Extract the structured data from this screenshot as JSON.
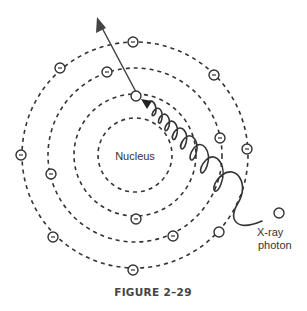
{
  "figure": {
    "caption": "FIGURE 2–29",
    "nucleus_label": "Nucleus",
    "photon_label_line1": "X-ray",
    "photon_label_line2": "photon",
    "colors": {
      "stroke": "#333333",
      "background": "#ffffff"
    },
    "center": [
      135,
      155
    ],
    "rings": [
      {
        "name": "shell-1",
        "radius": 37
      },
      {
        "name": "shell-2",
        "radius": 61
      },
      {
        "name": "shell-3",
        "radius": 87
      },
      {
        "name": "shell-4",
        "radius": 113
      }
    ],
    "electrons": [
      {
        "shell": 2,
        "x": 136,
        "y": 219
      },
      {
        "shell": 3,
        "x": 107,
        "y": 72
      },
      {
        "shell": 3,
        "x": 51,
        "y": 174
      },
      {
        "shell": 3,
        "x": 220,
        "y": 138
      },
      {
        "shell": 3,
        "x": 173,
        "y": 236
      },
      {
        "shell": 4,
        "x": 133,
        "y": 42
      },
      {
        "shell": 4,
        "x": 60,
        "y": 68
      },
      {
        "shell": 4,
        "x": 214,
        "y": 75
      },
      {
        "shell": 4,
        "x": 21,
        "y": 155
      },
      {
        "shell": 4,
        "x": 247,
        "y": 149
      },
      {
        "shell": 4,
        "x": 53,
        "y": 237
      },
      {
        "shell": 4,
        "x": 133,
        "y": 270
      }
    ],
    "vacancies": [
      {
        "name": "ejected-electron-origin",
        "x": 136,
        "y": 96
      },
      {
        "name": "shell-4-vacancy",
        "x": 219,
        "y": 232
      }
    ],
    "photon_marker": {
      "x": 279,
      "y": 213
    },
    "ejection_arrow": {
      "from": [
        136,
        96
      ],
      "to": [
        98,
        22
      ]
    }
  }
}
